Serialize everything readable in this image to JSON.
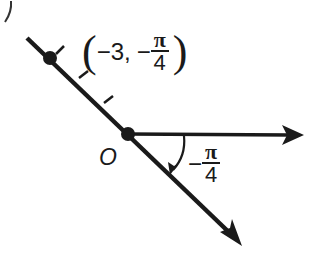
{
  "diagram": {
    "type": "polar-coordinate-plot",
    "partial_label_top_left": ")",
    "origin": {
      "label": "O",
      "x": 128,
      "y": 134
    },
    "polar_axis": {
      "from": [
        128,
        134
      ],
      "to": [
        302,
        136
      ],
      "direction": "right"
    },
    "terminal_ray": {
      "from": [
        27,
        38
      ],
      "to": [
        240,
        245
      ],
      "angle_label": {
        "sign": "−",
        "numerator": "π",
        "denominator": "4"
      }
    },
    "point": {
      "x": 50,
      "y": 58,
      "label": {
        "open": "(",
        "r": "−3",
        "sep": ",",
        "theta_sign": "−",
        "theta_num": "π",
        "theta_den": "4",
        "close": ")"
      }
    },
    "tick_marks": [
      {
        "at": [
          56,
          54
        ],
        "to": [
          64,
          46
        ]
      },
      {
        "at": [
          78,
          80
        ],
        "to": [
          87,
          72
        ]
      },
      {
        "at": [
          103,
          106
        ],
        "to": [
          112,
          97
        ]
      }
    ],
    "colors": {
      "stroke": "#1a1a1a",
      "background": "#ffffff"
    }
  }
}
